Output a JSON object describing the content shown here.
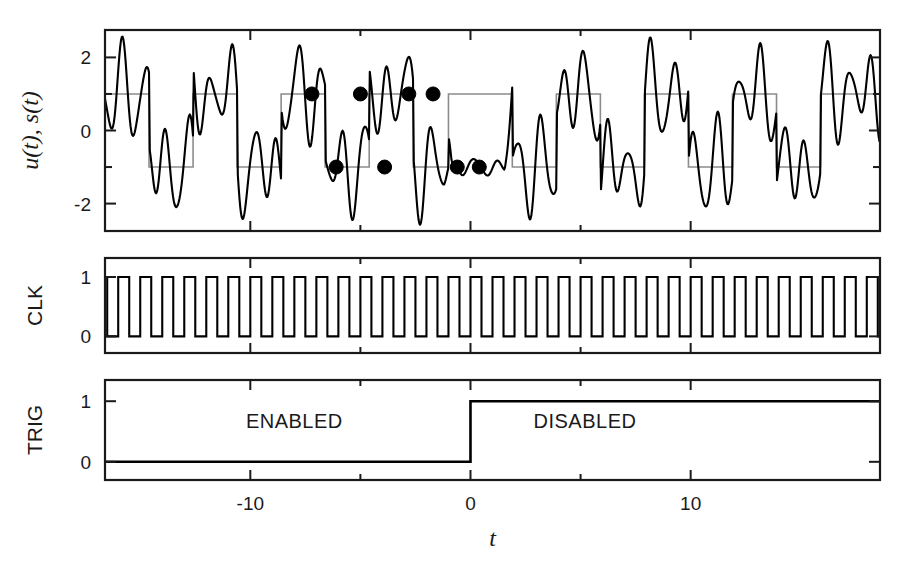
{
  "figure": {
    "width": 918,
    "height": 568,
    "background": "#ffffff",
    "axis_color": "#1a1a1a",
    "signal_color": "#000000",
    "square_color": "#8c8c8c",
    "marker_color": "#000000"
  },
  "axis": {
    "x_label": "t",
    "x_ticks_major": [
      -10,
      0,
      10
    ],
    "x_tick_labels": [
      "-10",
      "0",
      "10"
    ],
    "x_ticks_minor": [
      -5,
      5
    ],
    "x_range": [
      -16.6,
      18.6
    ]
  },
  "panels": [
    {
      "name": "signal-panel",
      "y_label": "u(t), s(t)",
      "y_ticks_major": [
        -2,
        0,
        2
      ],
      "y_tick_labels": [
        "-2",
        "0",
        "2"
      ],
      "y_ticks_minor": [
        -1,
        1
      ],
      "y_range": [
        -2.75,
        2.75
      ]
    },
    {
      "name": "clk-panel",
      "y_label": "CLK",
      "y_ticks_major": [
        0,
        1
      ],
      "y_tick_labels": [
        "0",
        "1"
      ],
      "y_range": [
        -0.28,
        1.32
      ]
    },
    {
      "name": "trig-panel",
      "y_label": "TRIG",
      "y_ticks_major": [
        0,
        1
      ],
      "y_tick_labels": [
        "0",
        "1"
      ],
      "y_range": [
        -0.3,
        1.35
      ]
    }
  ],
  "annotations": [
    {
      "name": "enabled-label",
      "text": "ENABLED",
      "t": -8.0,
      "y": 0.55
    },
    {
      "name": "disabled-label",
      "text": "DISABLED",
      "t": 5.2,
      "y": 0.55
    }
  ],
  "chart_data": {
    "type": "line",
    "title": "",
    "xlabel": "t",
    "ylabel": "u(t), s(t)",
    "xlim": [
      -16.6,
      18.6
    ],
    "grid": false,
    "legend": "none",
    "series": [
      {
        "name": "u(t)",
        "description": "noisy analog input signal, panel 1, black thin curve",
        "ylim": [
          -2.75,
          2.75
        ],
        "model": "sum_of_sines_plus_squarewave",
        "components": [
          {
            "amplitude": 1.0,
            "period": 4.0,
            "phase": 0.0,
            "kind": "square_base"
          },
          {
            "amplitude": 0.95,
            "period": 1.0,
            "phase": 0.35,
            "kind": "sine"
          },
          {
            "amplitude": 0.42,
            "period": 1.6,
            "phase": 1.1,
            "kind": "sine"
          },
          {
            "amplitude": 0.22,
            "period": 0.63,
            "phase": 2.2,
            "kind": "sine"
          }
        ],
        "suppressed_window": [
          -1.2,
          1.9
        ],
        "suppressed_gain": 0.18
      },
      {
        "name": "s(t)",
        "description": "binary reference square wave, panel 1, gray, levels -1 and +1",
        "levels": [
          -1,
          1
        ],
        "transitions_t": [
          -16.6,
          -14.6,
          -12.6,
          -10.6,
          -8.6,
          -6.6,
          -4.6,
          -2.6,
          -1.0,
          1.9,
          3.9,
          5.9,
          7.9,
          9.9,
          11.9,
          13.9,
          15.9,
          18.6
        ],
        "start_level": 1
      },
      {
        "name": "CLK",
        "description": "clock square wave, panel 2, levels 0 and 1, period 1.0",
        "levels": [
          0,
          1
        ],
        "period": 1.0,
        "duty": 0.5,
        "start_level": 1
      },
      {
        "name": "TRIG",
        "description": "trigger enable signal, panel 3, steps from 0 to 1 at t=0",
        "levels": [
          0,
          1
        ],
        "step_t": 0.0,
        "before": 0,
        "after": 1
      }
    ],
    "markers": {
      "name": "sampled-points",
      "description": "filled black circles marking sampled decision points in panel 1",
      "color": "#000000",
      "radius": 7,
      "points": [
        {
          "t": -7.2,
          "y": 1.0
        },
        {
          "t": -6.1,
          "y": -1.0
        },
        {
          "t": -5.0,
          "y": 1.0
        },
        {
          "t": -3.9,
          "y": -1.0
        },
        {
          "t": -2.8,
          "y": 1.0
        },
        {
          "t": -1.7,
          "y": 1.0
        },
        {
          "t": -0.6,
          "y": -1.0
        },
        {
          "t": 0.4,
          "y": -1.0
        }
      ]
    }
  }
}
